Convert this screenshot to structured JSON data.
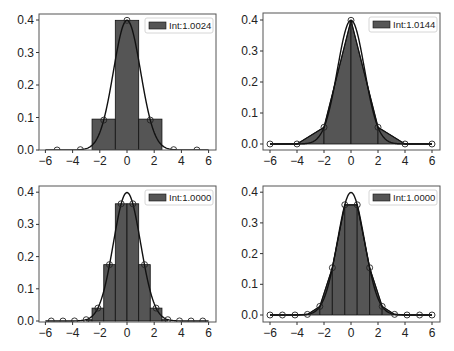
{
  "chart_data": [
    {
      "type": "bar",
      "panel": "top-left",
      "title": "",
      "xlabel": "",
      "ylabel": "",
      "xlim": [
        -6.5,
        6.5
      ],
      "ylim": [
        0,
        0.42
      ],
      "xticks": [
        -6,
        -4,
        -2,
        0,
        2,
        4,
        6
      ],
      "yticks": [
        0.0,
        0.1,
        0.2,
        0.3,
        0.4
      ],
      "legend": "Int:1.0024",
      "legend_position": "upper right",
      "method": "rectangles",
      "bars": [
        {
          "x0": -2.57,
          "x1": -0.86,
          "height": 0.095
        },
        {
          "x0": -0.86,
          "x1": 0.86,
          "height": 0.399
        },
        {
          "x0": 0.86,
          "x1": 2.57,
          "height": 0.095
        }
      ],
      "points": {
        "x": [
          -5.14,
          -3.43,
          -1.71,
          0,
          1.71,
          3.43,
          5.14
        ],
        "y": [
          0.0,
          0.001,
          0.092,
          0.399,
          0.092,
          0.001,
          0.0
        ]
      },
      "curve": "standard normal pdf"
    },
    {
      "type": "area",
      "panel": "top-right",
      "title": "",
      "xlabel": "",
      "ylabel": "",
      "xlim": [
        -6.5,
        6.5
      ],
      "ylim": [
        -0.012,
        0.41
      ],
      "xticks": [
        -6,
        -4,
        -2,
        0,
        2,
        4,
        6
      ],
      "yticks": [
        0.0,
        0.1,
        0.2,
        0.3,
        0.4
      ],
      "legend": "Int:1.0144",
      "legend_position": "upper right",
      "method": "trapezoids",
      "points": {
        "x": [
          -6,
          -4,
          -2,
          0,
          2,
          4,
          6
        ],
        "y": [
          0.0,
          0.0001,
          0.054,
          0.399,
          0.054,
          0.0001,
          0.0
        ]
      },
      "curve": "standard normal pdf"
    },
    {
      "type": "bar",
      "panel": "bottom-left",
      "title": "",
      "xlabel": "",
      "ylabel": "",
      "xlim": [
        -6.5,
        6.5
      ],
      "ylim": [
        0,
        0.41
      ],
      "xticks": [
        -6,
        -4,
        -2,
        0,
        2,
        4,
        6
      ],
      "yticks": [
        0.0,
        0.1,
        0.2,
        0.3,
        0.4
      ],
      "legend": "Int:1.0000",
      "legend_position": "upper right",
      "method": "rectangles",
      "bars": [
        {
          "x0": -3.0,
          "x1": -2.57,
          "height": 0.004
        },
        {
          "x0": -2.57,
          "x1": -1.71,
          "height": 0.04
        },
        {
          "x0": -1.71,
          "x1": -0.86,
          "height": 0.175
        },
        {
          "x0": -0.86,
          "x1": 0,
          "height": 0.364
        },
        {
          "x0": 0,
          "x1": 0.86,
          "height": 0.364
        },
        {
          "x0": 0.86,
          "x1": 1.71,
          "height": 0.175
        },
        {
          "x0": 1.71,
          "x1": 2.57,
          "height": 0.04
        },
        {
          "x0": 2.57,
          "x1": 3.0,
          "height": 0.004
        }
      ],
      "points": {
        "x": [
          -5.57,
          -4.71,
          -3.86,
          -3.0,
          -2.14,
          -1.29,
          -0.43,
          0.43,
          1.29,
          2.14,
          3.0,
          3.86,
          4.71,
          5.57
        ],
        "y": [
          0.0,
          0.0,
          0.0002,
          0.004,
          0.04,
          0.175,
          0.364,
          0.364,
          0.175,
          0.04,
          0.004,
          0.0002,
          0.0,
          0.0
        ]
      },
      "curve": "standard normal pdf"
    },
    {
      "type": "area",
      "panel": "bottom-right",
      "title": "",
      "xlabel": "",
      "ylabel": "",
      "xlim": [
        -6.5,
        6.5
      ],
      "ylim": [
        -0.012,
        0.41
      ],
      "xticks": [
        -6,
        -4,
        -2,
        0,
        2,
        4,
        6
      ],
      "yticks": [
        0.0,
        0.1,
        0.2,
        0.3,
        0.4
      ],
      "legend": "Int:1.0000",
      "legend_position": "upper right",
      "method": "trapezoids",
      "points": {
        "x": [
          -6,
          -5.08,
          -4.15,
          -3.23,
          -2.31,
          -1.38,
          -0.46,
          0.46,
          1.38,
          2.31,
          3.23,
          4.15,
          5.08,
          6
        ],
        "y": [
          0.0,
          0.0,
          0.0001,
          0.002,
          0.028,
          0.154,
          0.359,
          0.359,
          0.154,
          0.028,
          0.002,
          0.0001,
          0.0,
          0.0
        ]
      },
      "curve": "standard normal pdf"
    }
  ],
  "colors": {
    "fill": "#555555",
    "edge": "#111111",
    "axes": "#555555",
    "legend_border": "#cccccc"
  }
}
